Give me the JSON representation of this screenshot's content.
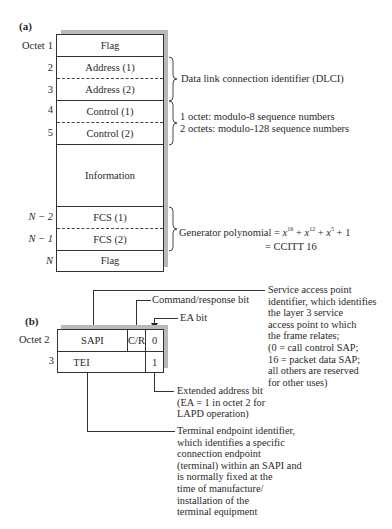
{
  "part_a": {
    "label": "(a)",
    "octet_header": "Octet",
    "rows": [
      {
        "octet": "1",
        "field": "Flag"
      },
      {
        "octet": "2",
        "field": "Address (1)"
      },
      {
        "octet": "3",
        "field": "Address (2)"
      },
      {
        "octet": "4",
        "field": "Control (1)"
      },
      {
        "octet": "5",
        "field": "Control (2)"
      },
      {
        "octet": "",
        "field": "Information"
      },
      {
        "octet": "N − 2",
        "field": "FCS (1)"
      },
      {
        "octet": "N − 1",
        "field": "FCS (2)"
      },
      {
        "octet": "N",
        "field": "Flag"
      }
    ],
    "annotations": {
      "dlci": "Data link connection identifier (DLCI)",
      "control_line1": "1 octet: modulo-8 sequence numbers",
      "control_line2": "2 octets: modulo-128 sequence numbers",
      "fcs_prefix": "Generator polynomial = ",
      "fcs_line2": "= CCITT 16"
    }
  },
  "part_b": {
    "label": "(b)",
    "octet_header": "Octet 2",
    "octet3": "3",
    "fields": {
      "sapi": "SAPI",
      "cr": "C/R",
      "ea0": "0",
      "tei": "TEI",
      "ea1": "1"
    },
    "annotations": {
      "cr_label": "Command/response bit",
      "ea_label": "EA bit",
      "sapi_desc": "Service access point\nidentifier, which identifies\nthe layer 3 service\naccess point to which\nthe frame relates;\n(0 = call control SAP;\n16 = packet data SAP;\nall others are reserved\nfor other uses)",
      "ext_addr_desc": "Extended address bit\n(EA = 1 in octet 2 for\nLAPD operation)",
      "tei_desc": "Terminal endpoint identifier,\nwhich identifies a specific\nconnection endpoint\n(terminal) within an SAPI and\nis normally fixed at the\ntime of manufacture/\ninstallation of the\nterminal equipment"
    }
  }
}
